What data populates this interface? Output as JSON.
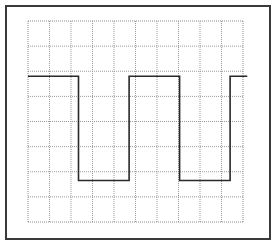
{
  "chart_data": {
    "type": "line",
    "title": "",
    "subtitle": "",
    "xlabel": "",
    "ylabel": "",
    "grid": true,
    "grid_style": "dotted",
    "graticule": {
      "columns": 10,
      "rows": 8
    },
    "xlim": [
      0,
      10
    ],
    "ylim": [
      -4,
      4
    ],
    "legend": null,
    "series": [
      {
        "name": "square-wave",
        "color": "#2a2a2a",
        "points": [
          {
            "x": 0.0,
            "y": 1.8
          },
          {
            "x": 2.35,
            "y": 1.8
          },
          {
            "x": 2.35,
            "y": -2.35
          },
          {
            "x": 4.7,
            "y": -2.35
          },
          {
            "x": 4.7,
            "y": 1.8
          },
          {
            "x": 7.05,
            "y": 1.8
          },
          {
            "x": 7.05,
            "y": -2.35
          },
          {
            "x": 9.4,
            "y": -2.35
          },
          {
            "x": 9.4,
            "y": 1.8
          },
          {
            "x": 10.2,
            "y": 1.8
          }
        ],
        "high_level_div": 1.8,
        "low_level_div": -2.35,
        "period_div": 4.7,
        "duty_cycle_pct": 50
      }
    ]
  },
  "colors": {
    "frame": "#3a3a3a",
    "grid": "#9a9a9a",
    "trace": "#2a2a2a",
    "background": "#ffffff"
  }
}
